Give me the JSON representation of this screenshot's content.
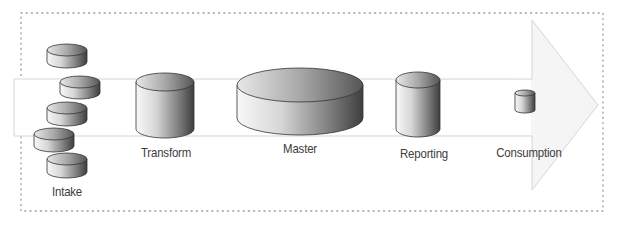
{
  "diagram": {
    "type": "data-pipeline-flow",
    "direction": "left-to-right",
    "stages": [
      {
        "id": "intake",
        "label": "Intake",
        "shape": "cylinder-stack",
        "count": 5
      },
      {
        "id": "transform",
        "label": "Transform",
        "shape": "cylinder"
      },
      {
        "id": "master",
        "label": "Master",
        "shape": "wide-cylinder"
      },
      {
        "id": "reporting",
        "label": "Reporting",
        "shape": "cylinder"
      },
      {
        "id": "consumption",
        "label": "Consumption",
        "shape": "small-cylinder"
      }
    ],
    "background_shape": "block-arrow-right",
    "frame": "dotted-border"
  },
  "colors": {
    "frame_dots": "#9a9a9a",
    "arrow_outline": "#d8d8d8",
    "cylinder_light": "#f6f6f6",
    "cylinder_dark": "#4a4a4a",
    "label_text": "#3c3c3c"
  }
}
